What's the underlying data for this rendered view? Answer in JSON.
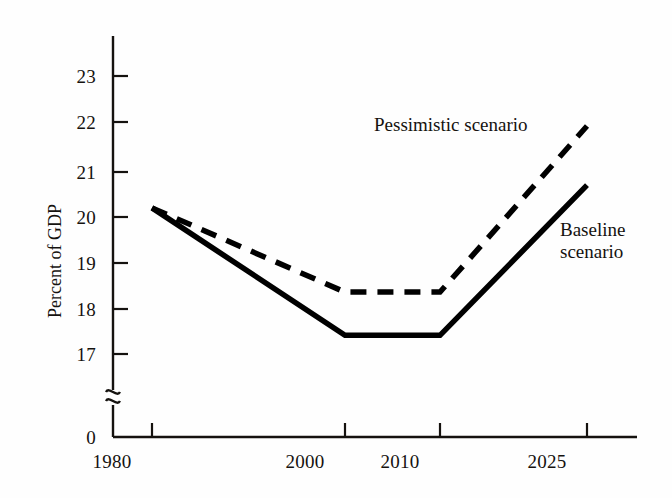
{
  "chart_data": {
    "type": "line",
    "title": "",
    "subtitle": "",
    "xlabel": "",
    "ylabel": "Percent of GDP",
    "x": [
      1980,
      2000,
      2010,
      2025
    ],
    "xtick_labels": [
      "1980",
      "2000",
      "2010",
      "2025"
    ],
    "ytick_labels": [
      "0",
      "17",
      "18",
      "19",
      "20",
      "21",
      "22",
      "23"
    ],
    "ylim": [
      17,
      23.6
    ],
    "y_axis_break": true,
    "y_axis_break_symbol": "~",
    "y_zero_label": "0",
    "grid": false,
    "legend_position": "inline-annotation",
    "series": [
      {
        "name": "Pessimistic scenario",
        "style": "dashed",
        "color": "#000000",
        "values": [
          20.2,
          18.35,
          18.35,
          22.0
        ]
      },
      {
        "name": "Baseline scenario",
        "style": "solid",
        "color": "#000000",
        "values": [
          20.2,
          17.4,
          17.4,
          20.7
        ]
      }
    ],
    "annotations": [
      {
        "text": "Pessimistic scenario",
        "series": "Pessimistic scenario"
      },
      {
        "text": "Baseline",
        "series": "Baseline scenario"
      },
      {
        "text": "scenario",
        "series": "Baseline scenario"
      }
    ]
  },
  "axes": {
    "y_title": "Percent of GDP",
    "y_ticks": [
      {
        "label": "23"
      },
      {
        "label": "22"
      },
      {
        "label": "21"
      },
      {
        "label": "20"
      },
      {
        "label": "19"
      },
      {
        "label": "18"
      },
      {
        "label": "17"
      },
      {
        "label": "0"
      }
    ],
    "y_break_symbol": "~",
    "x_ticks": [
      {
        "label": "1980"
      },
      {
        "label": "2000"
      },
      {
        "label": "2010"
      },
      {
        "label": "2025"
      }
    ]
  },
  "labels": {
    "pessimistic": "Pessimistic scenario",
    "baseline_line1": "Baseline",
    "baseline_line2": "scenario"
  }
}
